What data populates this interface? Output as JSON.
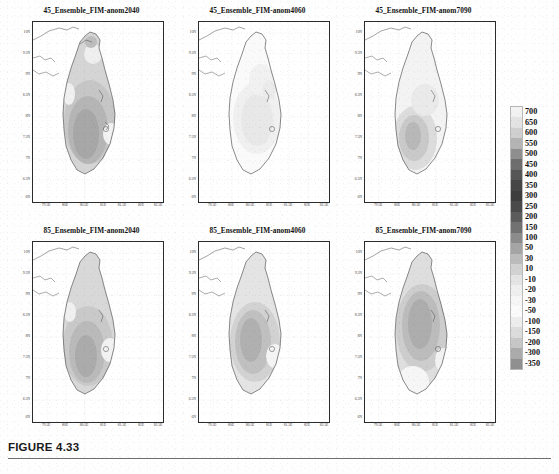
{
  "figure": {
    "caption_label": "FIGURE 4.33",
    "panel_count": 6
  },
  "colorbar": {
    "name": "rainfall-anomaly-colorbar",
    "orientation": "vertical",
    "labels": [
      "700",
      "650",
      "600",
      "550",
      "500",
      "450",
      "400",
      "350",
      "300",
      "250",
      "200",
      "150",
      "100",
      "50",
      "30",
      "10",
      "-10",
      "-20",
      "-30",
      "-50",
      "-100",
      "-150",
      "-200",
      "-300",
      "-350"
    ],
    "colors": [
      "#f2f2f2",
      "#e3e3e3",
      "#cfcfcf",
      "#b4b4b4",
      "#8f8f8f",
      "#6e6e6e",
      "#565656",
      "#464646",
      "#3d3d3d",
      "#4a4a4a",
      "#5c5c5c",
      "#727272",
      "#8c8c8c",
      "#a5a5a5",
      "#bcbcbc",
      "#d2d2d2",
      "#e4e4e4",
      "#efefef",
      "#f6f6f6",
      "#fbfbfb",
      "#ededed",
      "#dcdcdc",
      "#c7c7c7",
      "#ababab",
      "#909090"
    ]
  },
  "axes": {
    "ytick_labels": [
      "10N",
      "9.5N",
      "9N",
      "8.5N",
      "8N",
      "7.5N",
      "7N",
      "6.5N",
      "6N"
    ],
    "xtick_labels": [
      "79.5E",
      "80E",
      "80.5E",
      "81E",
      "81.5E",
      "82E",
      "82.5E"
    ]
  },
  "panels": [
    {
      "id": "panel-45-anom2040",
      "title": "45_Ensemble_FIM-anom2040",
      "row": 0,
      "col": 0
    },
    {
      "id": "panel-45-anom4060",
      "title": "45_Ensemble_FIM-anom4060",
      "row": 0,
      "col": 1
    },
    {
      "id": "panel-45-anom7090",
      "title": "45_Ensemble_FIM-anom7090",
      "row": 0,
      "col": 2
    },
    {
      "id": "panel-85-anom2040",
      "title": "85_Ensemble_FIM-anom2040",
      "row": 1,
      "col": 0
    },
    {
      "id": "panel-85-anom4060",
      "title": "85_Ensemble_FIM-anom4060",
      "row": 1,
      "col": 1
    },
    {
      "id": "panel-85-anom7090",
      "title": "85_Ensemble_FIM-anom7090",
      "row": 1,
      "col": 2
    }
  ],
  "chart_data": {
    "type": "heatmap",
    "title": "FIGURE 4.33",
    "subtitle": "Ensemble mean rainfall anomaly maps over Sri Lanka for RCP4.5 and RCP8.5",
    "xlabel": "Longitude",
    "ylabel": "Latitude",
    "xlim": [
      79.3,
      82.6
    ],
    "ylim": [
      5.8,
      10.1
    ],
    "xticks": [
      79.5,
      80.0,
      80.5,
      81.0,
      81.5,
      82.0,
      82.5
    ],
    "xtick_labels": [
      "79.5E",
      "80E",
      "80.5E",
      "81E",
      "81.5E",
      "82E",
      "82.5E"
    ],
    "yticks": [
      10.0,
      9.5,
      9.0,
      8.5,
      8.0,
      7.5,
      7.0,
      6.5,
      6.0
    ],
    "ytick_labels": [
      "10N",
      "9.5N",
      "9N",
      "8.5N",
      "8N",
      "7.5N",
      "7N",
      "6.5N",
      "6N"
    ],
    "grid": true,
    "legend": "right colorbar",
    "colorbar_levels": [
      700,
      650,
      600,
      550,
      500,
      450,
      400,
      350,
      300,
      250,
      200,
      150,
      100,
      50,
      30,
      10,
      -10,
      -20,
      -30,
      -50,
      -100,
      -150,
      -200,
      -300,
      -350
    ],
    "units": "mm",
    "panels": [
      {
        "name": "45_Ensemble_FIM-anom2040",
        "scenario": "RCP4.5",
        "period": "2020-2040",
        "region": "Sri Lanka",
        "peak_anomaly": 300,
        "min_anomaly": 10,
        "peak_location": "south-central highlands",
        "description": "Moderate positive anomaly island-wide with maximum core over the south-central wet zone"
      },
      {
        "name": "45_Ensemble_FIM-anom4060",
        "scenario": "RCP4.5",
        "period": "2040-2060",
        "region": "Sri Lanka",
        "peak_anomaly": 100,
        "min_anomaly": 10,
        "peak_location": "central interior",
        "description": "Weak positive anomaly over most of the island"
      },
      {
        "name": "45_Ensemble_FIM-anom7090",
        "scenario": "RCP4.5",
        "period": "2070-2090",
        "region": "Sri Lanka",
        "peak_anomaly": 250,
        "min_anomaly": 10,
        "peak_location": "southwest quadrant",
        "description": "Positive anomaly strongest over the southwestern sector"
      },
      {
        "name": "85_Ensemble_FIM-anom2040",
        "scenario": "RCP8.5",
        "period": "2020-2040",
        "region": "Sri Lanka",
        "peak_anomaly": 300,
        "min_anomaly": 30,
        "peak_location": "south-central highlands",
        "description": "Broad positive anomaly with core over the south-central region"
      },
      {
        "name": "85_Ensemble_FIM-anom4060",
        "scenario": "RCP8.5",
        "period": "2040-2060",
        "region": "Sri Lanka",
        "peak_anomaly": 350,
        "min_anomaly": 30,
        "peak_location": "central-west",
        "description": "Large positive anomaly centred on the central-western interior"
      },
      {
        "name": "85_Ensemble_FIM-anom7090",
        "scenario": "RCP8.5",
        "period": "2070-2090",
        "region": "Sri Lanka",
        "peak_anomaly": 400,
        "min_anomaly": 30,
        "peak_location": "central highlands",
        "description": "Strongest and most extensive positive anomaly covering the central highlands"
      }
    ]
  }
}
